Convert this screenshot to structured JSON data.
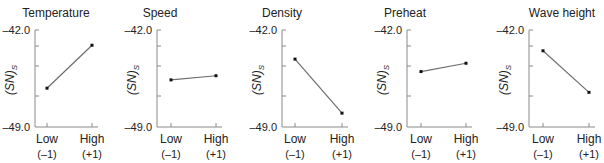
{
  "chart_data": [
    {
      "type": "line",
      "title": "Temperature",
      "categories": [
        "Low",
        "High"
      ],
      "category_codes": [
        "(–1)",
        "(+1)"
      ],
      "values": [
        -46.2,
        -43.1
      ],
      "xlabel": "",
      "ylabel": "(SN)S",
      "ylim": [
        -49.0,
        -42.0
      ],
      "yticks_labeled": [
        "-42.0",
        "-49.0"
      ],
      "grid": false
    },
    {
      "type": "line",
      "title": "Speed",
      "categories": [
        "Low",
        "High"
      ],
      "category_codes": [
        "(–1)",
        "(+1)"
      ],
      "values": [
        -45.6,
        -45.3
      ],
      "xlabel": "",
      "ylabel": "(SN)S",
      "ylim": [
        -49.0,
        -42.0
      ],
      "yticks_labeled": [
        "-42.0",
        "-49.0"
      ],
      "grid": false
    },
    {
      "type": "line",
      "title": "Density",
      "categories": [
        "Low",
        "High"
      ],
      "category_codes": [
        "(–1)",
        "(+1)"
      ],
      "values": [
        -44.1,
        -48.0
      ],
      "xlabel": "",
      "ylabel": "(SN)S",
      "ylim": [
        -49.0,
        -42.0
      ],
      "yticks_labeled": [
        "-42.0",
        "-49.0"
      ],
      "grid": false
    },
    {
      "type": "line",
      "title": "Preheat",
      "categories": [
        "Low",
        "High"
      ],
      "category_codes": [
        "(–1)",
        "(+1)"
      ],
      "values": [
        -45.0,
        -44.4
      ],
      "xlabel": "",
      "ylabel": "(SN)S",
      "ylim": [
        -49.0,
        -42.0
      ],
      "yticks_labeled": [
        "-42.0",
        "-49.0"
      ],
      "grid": false
    },
    {
      "type": "line",
      "title": "Wave height",
      "categories": [
        "Low",
        "High"
      ],
      "category_codes": [
        "(–1)",
        "(+1)"
      ],
      "values": [
        -43.5,
        -46.5
      ],
      "xlabel": "",
      "ylabel": "(SN)S",
      "ylim": [
        -49.0,
        -42.0
      ],
      "yticks_labeled": [
        "-42.0",
        "-49.0"
      ],
      "grid": false
    }
  ],
  "labels": {
    "ymax": "–42.0",
    "ymin": "–49.0",
    "ylabel_main": "(SN)",
    "ylabel_sub": "S",
    "low": "Low",
    "high": "High",
    "low_code": "(–1)",
    "high_code": "(+1)"
  },
  "panels": [
    {
      "title": "Temperature"
    },
    {
      "title": "Speed"
    },
    {
      "title": "Density"
    },
    {
      "title": "Preheat"
    },
    {
      "title": "Wave height"
    }
  ],
  "colors": {
    "axis": "#8a8a8a",
    "line": "#6e6e6e",
    "point": "#111111",
    "text": "#222222"
  }
}
